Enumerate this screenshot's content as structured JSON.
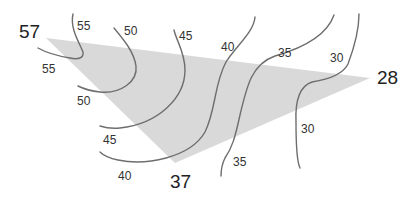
{
  "diagram": {
    "title": "",
    "fill_color": "#d9d9d9",
    "line_color": "#6e6e6e",
    "vertices": [
      {
        "id": "top-left",
        "value": "57"
      },
      {
        "id": "right",
        "value": "28"
      },
      {
        "id": "bottom",
        "value": "37"
      }
    ],
    "contours": [
      {
        "id": "c55",
        "value": 55,
        "labels": [
          "55",
          "55"
        ]
      },
      {
        "id": "c50",
        "value": 50,
        "labels": [
          "50",
          "50"
        ]
      },
      {
        "id": "c45",
        "value": 45,
        "labels": [
          "45",
          "45"
        ]
      },
      {
        "id": "c40",
        "value": 40,
        "labels": [
          "40",
          "40"
        ]
      },
      {
        "id": "c35",
        "value": 35,
        "labels": [
          "35",
          "35"
        ]
      },
      {
        "id": "c30",
        "value": 30,
        "labels": [
          "30",
          "30"
        ]
      }
    ]
  }
}
